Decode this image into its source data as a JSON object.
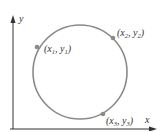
{
  "diagram": {
    "axes": {
      "x_label": "x",
      "y_label": "y",
      "color": "#333333"
    },
    "circle": {
      "cx": 80,
      "cy": 72,
      "r": 47,
      "stroke": "#8a8a8a"
    },
    "points": [
      {
        "name": "point-1",
        "label_open": "(x",
        "sub1": "1",
        "sep": ", y",
        "sub2": "1",
        "close": ")",
        "cx": 37,
        "cy": 47
      },
      {
        "name": "point-2",
        "label_open": "(x",
        "sub1": "2",
        "sep": ", y",
        "sub2": "2",
        "close": ")",
        "cx": 113,
        "cy": 38
      },
      {
        "name": "point-3",
        "label_open": "(x",
        "sub1": "3",
        "sep": ", y",
        "sub2": "3",
        "close": ")",
        "cx": 103,
        "cy": 114
      }
    ],
    "point_color": "#8a8a8a"
  }
}
